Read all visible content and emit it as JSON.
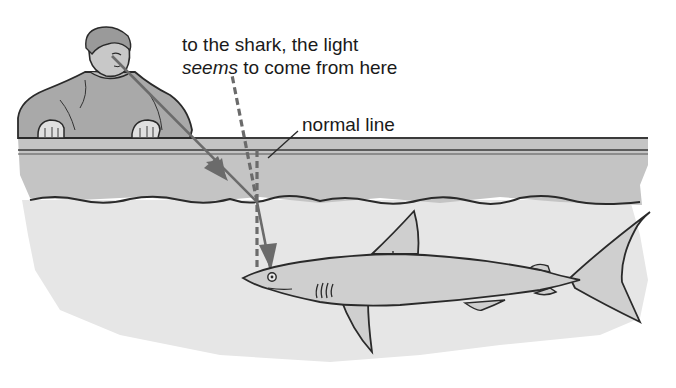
{
  "diagram": {
    "topic": "refraction of light at water surface",
    "labels": {
      "apparent_source_line1": "to the shark, the light",
      "apparent_source_line2_italic": "seems",
      "apparent_source_line2_rest": " to come from here",
      "normal_line": "normal line"
    },
    "elements": {
      "observer": "boy leaning over tank edge",
      "tank_edge": "glass tank top with water layer",
      "water": "water below surface",
      "shark": "shark swimming left",
      "incident_ray": "solid arrow from boy's eye to water surface",
      "refracted_ray": "solid arrow from surface to shark's eye",
      "apparent_ray": "dashed line extending refracted ray upward",
      "normal": "dashed vertical normal line at point of incidence"
    },
    "colors": {
      "ray": "#6b6b6b",
      "outline": "#2a2a2a",
      "tank_band": "#c4c4c4",
      "water": "#e6e6e6",
      "shark_body": "#cfcfcf",
      "clothing": "#a9a9a9",
      "text": "#1a1a1a"
    }
  }
}
